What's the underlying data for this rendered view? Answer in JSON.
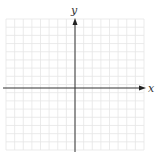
{
  "diagram": {
    "type": "coordinate-plane",
    "x_axis_label": "x",
    "y_axis_label": "y",
    "grid": {
      "columns": 16,
      "rows": 16,
      "color": "#e6e6e6"
    },
    "axis_color": "#333333"
  }
}
